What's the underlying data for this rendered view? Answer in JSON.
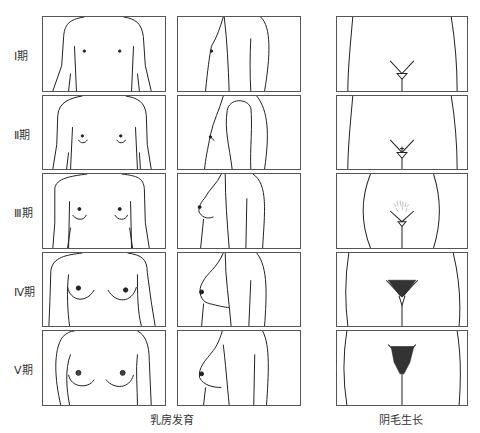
{
  "figure": {
    "rows": [
      {
        "stage_label": "Ⅰ期"
      },
      {
        "stage_label": "Ⅱ期"
      },
      {
        "stage_label": "Ⅲ期"
      },
      {
        "stage_label": "Ⅳ期"
      },
      {
        "stage_label": "Ⅴ期"
      }
    ],
    "columns": [
      {
        "name": "breast-front-view"
      },
      {
        "name": "breast-side-view"
      },
      {
        "name": "pubic-hair-front-view"
      }
    ],
    "captions": {
      "breast": "乳房发育",
      "pubic_hair": "阴毛生长"
    },
    "colors": {
      "line": "#222222",
      "border": "#555555",
      "background": "#ffffff"
    }
  }
}
